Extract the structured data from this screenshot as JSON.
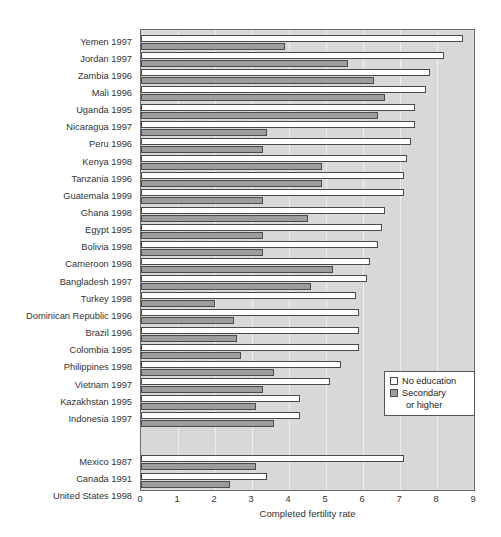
{
  "chart_data": {
    "type": "bar",
    "orientation": "horizontal",
    "title": "",
    "xlabel": "Completed fertility rate",
    "ylabel": "",
    "xlim": [
      0,
      9
    ],
    "xticks": [
      "0",
      "1",
      "2",
      "3",
      "4",
      "5",
      "6",
      "7",
      "8",
      "9"
    ],
    "grid": true,
    "legend_position": "lower-right",
    "series": [
      {
        "name": "No education",
        "key": "no_education",
        "color": "#ffffff"
      },
      {
        "name": "Secondary or higher",
        "key": "secondary",
        "color": "#9d9d9d"
      }
    ],
    "categories": [
      "Yemen 1997",
      "Jordan 1997",
      "Zambia 1996",
      "Mali 1996",
      "Uganda 1995",
      "Nicaragua 1997",
      "Peru 1996",
      "Kenya 1998",
      "Tanzania 1996",
      "Guatemala 1999",
      "Ghana 1998",
      "Egypt 1995",
      "Bolivia 1998",
      "Cameroon 1998",
      "Bangladesh 1997",
      "Turkey 1998",
      "Dominican Republic 1996",
      "Brazil 1996",
      "Colombia 1995",
      "Philippines 1998",
      "Vietnam 1997",
      "Kazakhstan 1995",
      "Indonesia 1997",
      "Mexico 1987",
      "Canada 1991",
      "United States 1998"
    ],
    "rows": [
      {
        "label": "Yemen 1997",
        "no_education": 8.7,
        "secondary": 3.9,
        "group": 1
      },
      {
        "label": "Jordan 1997",
        "no_education": 8.2,
        "secondary": 5.6,
        "group": 1
      },
      {
        "label": "Zambia 1996",
        "no_education": 7.8,
        "secondary": 6.3,
        "group": 1
      },
      {
        "label": "Mali 1996",
        "no_education": 7.7,
        "secondary": 6.6,
        "group": 1
      },
      {
        "label": "Uganda 1995",
        "no_education": 7.4,
        "secondary": 6.4,
        "group": 1
      },
      {
        "label": "Nicaragua 1997",
        "no_education": 7.4,
        "secondary": 3.4,
        "group": 1
      },
      {
        "label": "Peru 1996",
        "no_education": 7.3,
        "secondary": 3.3,
        "group": 1
      },
      {
        "label": "Kenya 1998",
        "no_education": 7.2,
        "secondary": 4.9,
        "group": 1
      },
      {
        "label": "Tanzania 1996",
        "no_education": 7.1,
        "secondary": 4.9,
        "group": 1
      },
      {
        "label": "Guatemala 1999",
        "no_education": 7.1,
        "secondary": 3.3,
        "group": 1
      },
      {
        "label": "Ghana 1998",
        "no_education": 6.6,
        "secondary": 4.5,
        "group": 1
      },
      {
        "label": "Egypt 1995",
        "no_education": 6.5,
        "secondary": 3.3,
        "group": 1
      },
      {
        "label": "Bolivia 1998",
        "no_education": 6.4,
        "secondary": 3.3,
        "group": 1
      },
      {
        "label": "Cameroon 1998",
        "no_education": 6.2,
        "secondary": 5.2,
        "group": 1
      },
      {
        "label": "Bangladesh 1997",
        "no_education": 6.1,
        "secondary": 4.6,
        "group": 1
      },
      {
        "label": "Turkey 1998",
        "no_education": 5.8,
        "secondary": 2.0,
        "group": 1
      },
      {
        "label": "Dominican Republic 1996",
        "no_education": 5.9,
        "secondary": 2.5,
        "group": 1
      },
      {
        "label": "Brazil 1996",
        "no_education": 5.9,
        "secondary": 2.6,
        "group": 1
      },
      {
        "label": "Colombia 1995",
        "no_education": 5.9,
        "secondary": 2.7,
        "group": 1
      },
      {
        "label": "Philippines 1998",
        "no_education": 5.4,
        "secondary": 3.6,
        "group": 1
      },
      {
        "label": "Vietnam 1997",
        "no_education": 5.1,
        "secondary": 3.3,
        "group": 1
      },
      {
        "label": "Kazakhstan 1995",
        "no_education": 4.3,
        "secondary": 3.1,
        "group": 1
      },
      {
        "label": "Indonesia 1997",
        "no_education": 4.3,
        "secondary": 3.6,
        "group": 1
      },
      {
        "label": "Mexico 1987",
        "no_education": 7.1,
        "secondary": 3.1,
        "group": 2
      },
      {
        "label": "Canada 1991",
        "no_education": 3.4,
        "secondary": 2.4,
        "group": 2
      },
      {
        "label": "United States 1998",
        "no_education": 2.6,
        "secondary": 1.8,
        "group": 2
      }
    ]
  },
  "legend": {
    "items": [
      {
        "label": "No education"
      },
      {
        "label": "Secondary"
      }
    ],
    "continuation": "or higher"
  },
  "axis": {
    "x_title": "Completed fertility rate"
  },
  "colors": {
    "plot_background": "#d8d8d8",
    "no_education": "#ffffff",
    "secondary": "#9d9d9d",
    "gridline": "#efefef",
    "frame": "#6e6e6e"
  }
}
